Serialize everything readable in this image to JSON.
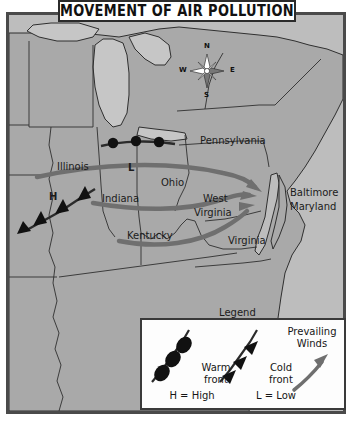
{
  "title": {
    "text": "MOVEMENT OF AIR POLLUTION"
  },
  "compass": {
    "north": "N",
    "south": "S",
    "east": "E",
    "west": "W"
  },
  "map": {
    "legend_caption": "Legend",
    "states": [
      {
        "name": "Illinois",
        "x": 55,
        "y": 154
      },
      {
        "name": "Indiana",
        "x": 100,
        "y": 184
      },
      {
        "name": "Ohio",
        "x": 158,
        "y": 170
      },
      {
        "name": "Pennsylvania",
        "x": 203,
        "y": 128
      },
      {
        "name": "West",
        "x": 200,
        "y": 186
      },
      {
        "name": "Virginia",
        "x": 191,
        "y": 200
      },
      {
        "name": "Kentucky",
        "x": 125,
        "y": 222
      },
      {
        "name": "Virginia",
        "x": 225,
        "y": 227
      }
    ],
    "cities": [
      {
        "name": "Baltimore",
        "x": 289,
        "y": 180
      },
      {
        "name": "Maryland",
        "x": 289,
        "y": 194
      }
    ],
    "pressure_markers": [
      {
        "label": "H",
        "x": 46,
        "y": 184
      },
      {
        "label": "L",
        "x": 124,
        "y": 155
      }
    ]
  },
  "legend": {
    "warm_front_label_line1": "Warm",
    "warm_front_label_line2": "front",
    "cold_front_label_line1": "Cold",
    "cold_front_label_line2": "front",
    "prevailing_winds_line1": "Prevailing",
    "prevailing_winds_line2": "Winds",
    "high_key": "H = High",
    "low_key": "L = Low"
  },
  "colors": {
    "land": "#a9a9a9",
    "water": "#c6c6c6",
    "ocean": "#bdbdbd",
    "border_line": "#2f2f2f",
    "arrow_gray": "#6f6f6f",
    "front_line": "#3a3a3a",
    "frame": "#4a4a4a",
    "plaque_bg": "#ffffff"
  }
}
